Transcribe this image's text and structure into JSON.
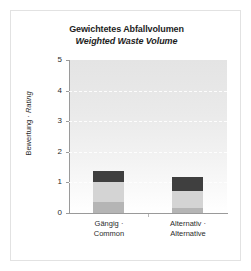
{
  "chart_data": {
    "type": "bar",
    "subtype": "stacked",
    "title": "Gewichtetes Abfallvolumen",
    "subtitle": "Weighted Waste Volume",
    "xlabel": "",
    "ylabel": "Bewertung · Rating",
    "ylim": [
      0,
      5
    ],
    "yticks": [
      "0",
      "1",
      "2",
      "3",
      "4",
      "5"
    ],
    "grid": true,
    "grid_values": [
      1,
      2,
      3,
      4
    ],
    "legend": "none",
    "categories": [
      "Gängig · Common",
      "Alternativ · Alternative"
    ],
    "category_lines": [
      [
        "Gängig ·",
        "Common"
      ],
      [
        "Alternativ ·",
        "Alternative"
      ]
    ],
    "series": [
      {
        "name": "segment-bottom",
        "color": "#b5b5b5",
        "values": [
          0.37,
          0.15
        ]
      },
      {
        "name": "segment-middle",
        "color": "#d4d4d4",
        "values": [
          0.63,
          0.58
        ]
      },
      {
        "name": "segment-top",
        "color": "#3f3f3f",
        "values": [
          0.37,
          0.45
        ]
      }
    ],
    "totals": [
      1.37,
      1.18
    ]
  },
  "colors": {
    "plot_background_top": "#e4e4e4",
    "plot_background_bottom": "#ffffff",
    "axis_line": "#9a9a9a",
    "gridline": "#ffffff",
    "card_border": "#e2e2e2",
    "text": "#2b2b2b",
    "title_text": "#1d1d1d"
  }
}
